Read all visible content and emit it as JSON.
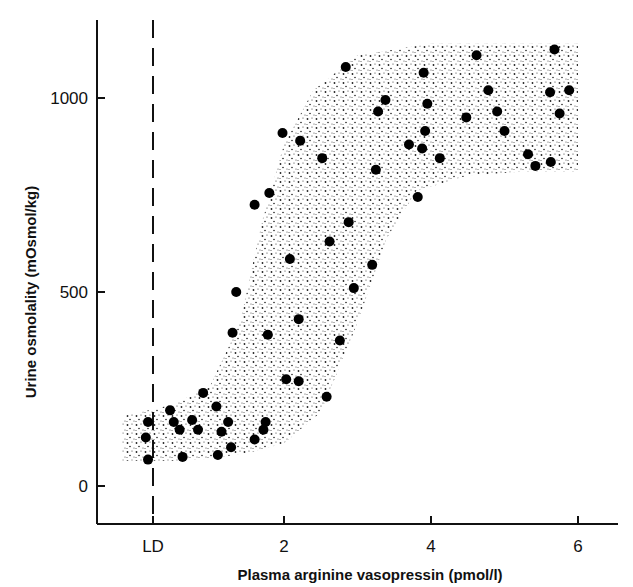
{
  "chart_data": {
    "type": "scatter",
    "title": "",
    "xlabel": "Plasma arginine vasopressin  (pmol/l)",
    "ylabel": "Urine osmolality (mOsmol/kg)",
    "xlim": [
      -0.25,
      6.5
    ],
    "ylim": [
      -100,
      1200
    ],
    "x_ticks": [
      {
        "value": 0.2,
        "label": "LD"
      },
      {
        "value": 2,
        "label": "2"
      },
      {
        "value": 4,
        "label": "4"
      },
      {
        "value": 6,
        "label": "6"
      }
    ],
    "y_ticks": [
      {
        "value": 0,
        "label": "0"
      },
      {
        "value": 500,
        "label": "500"
      },
      {
        "value": 1000,
        "label": "1000"
      }
    ],
    "grid": false,
    "legend": null,
    "annotations": [
      {
        "type": "vertical-dashed-line",
        "x": 0.2,
        "label": "LD",
        "meaning": "limit of detection"
      },
      {
        "type": "stippled-band",
        "meaning": "sigmoid range of normal response, rising from ~70-180 mOsmol/kg near LD to ~820-1140 mOsmol/kg above 4.5 pmol/l"
      }
    ],
    "series": [
      {
        "name": "Observations",
        "marker": "filled-circle",
        "color": "#000000",
        "points": [
          {
            "x": 0.15,
            "y": 165
          },
          {
            "x": 0.12,
            "y": 125
          },
          {
            "x": 0.15,
            "y": 68
          },
          {
            "x": 0.45,
            "y": 195
          },
          {
            "x": 0.5,
            "y": 165
          },
          {
            "x": 0.58,
            "y": 145
          },
          {
            "x": 0.62,
            "y": 75
          },
          {
            "x": 0.75,
            "y": 170
          },
          {
            "x": 0.83,
            "y": 145
          },
          {
            "x": 0.9,
            "y": 240
          },
          {
            "x": 1.08,
            "y": 205
          },
          {
            "x": 1.1,
            "y": 80
          },
          {
            "x": 1.15,
            "y": 140
          },
          {
            "x": 1.24,
            "y": 165
          },
          {
            "x": 1.28,
            "y": 100
          },
          {
            "x": 1.6,
            "y": 120
          },
          {
            "x": 1.72,
            "y": 145
          },
          {
            "x": 1.75,
            "y": 165
          },
          {
            "x": 1.3,
            "y": 395
          },
          {
            "x": 1.35,
            "y": 500
          },
          {
            "x": 1.6,
            "y": 725
          },
          {
            "x": 1.78,
            "y": 390
          },
          {
            "x": 1.8,
            "y": 755
          },
          {
            "x": 1.98,
            "y": 910
          },
          {
            "x": 2.03,
            "y": 275
          },
          {
            "x": 2.08,
            "y": 585
          },
          {
            "x": 2.2,
            "y": 270
          },
          {
            "x": 2.2,
            "y": 430
          },
          {
            "x": 2.22,
            "y": 890
          },
          {
            "x": 2.52,
            "y": 845
          },
          {
            "x": 2.62,
            "y": 630
          },
          {
            "x": 2.58,
            "y": 230
          },
          {
            "x": 2.76,
            "y": 375
          },
          {
            "x": 2.84,
            "y": 1080
          },
          {
            "x": 2.88,
            "y": 680
          },
          {
            "x": 2.95,
            "y": 510
          },
          {
            "x": 3.2,
            "y": 570
          },
          {
            "x": 3.25,
            "y": 815
          },
          {
            "x": 3.28,
            "y": 965
          },
          {
            "x": 3.38,
            "y": 995
          },
          {
            "x": 3.7,
            "y": 880
          },
          {
            "x": 3.82,
            "y": 745
          },
          {
            "x": 3.88,
            "y": 870
          },
          {
            "x": 3.9,
            "y": 1065
          },
          {
            "x": 3.92,
            "y": 915
          },
          {
            "x": 3.95,
            "y": 985
          },
          {
            "x": 4.12,
            "y": 845
          },
          {
            "x": 4.48,
            "y": 950
          },
          {
            "x": 4.62,
            "y": 1110
          },
          {
            "x": 4.78,
            "y": 1020
          },
          {
            "x": 4.9,
            "y": 965
          },
          {
            "x": 5.0,
            "y": 915
          },
          {
            "x": 5.32,
            "y": 855
          },
          {
            "x": 5.42,
            "y": 825
          },
          {
            "x": 5.62,
            "y": 1015
          },
          {
            "x": 5.63,
            "y": 835
          },
          {
            "x": 5.68,
            "y": 1125
          },
          {
            "x": 5.75,
            "y": 960
          },
          {
            "x": 5.88,
            "y": 1020
          }
        ]
      }
    ],
    "band": {
      "upper": [
        [
          -0.2,
          180
        ],
        [
          0.5,
          210
        ],
        [
          1.0,
          260
        ],
        [
          1.4,
          420
        ],
        [
          1.7,
          680
        ],
        [
          2.0,
          880
        ],
        [
          2.4,
          1020
        ],
        [
          3.0,
          1110
        ],
        [
          4.0,
          1140
        ],
        [
          5.0,
          1140
        ],
        [
          6.0,
          1140
        ]
      ],
      "lower": [
        [
          -0.2,
          65
        ],
        [
          0.5,
          65
        ],
        [
          1.0,
          70
        ],
        [
          1.5,
          85
        ],
        [
          2.0,
          110
        ],
        [
          2.5,
          190
        ],
        [
          3.0,
          420
        ],
        [
          3.4,
          640
        ],
        [
          3.8,
          760
        ],
        [
          4.5,
          800
        ],
        [
          5.2,
          810
        ],
        [
          6.0,
          810
        ]
      ]
    }
  }
}
